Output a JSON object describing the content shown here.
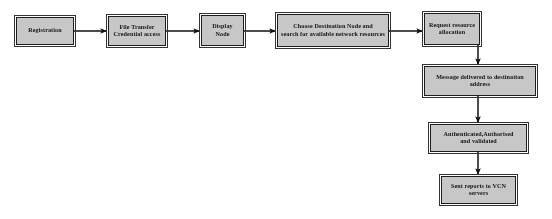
{
  "diagram": {
    "style": {
      "node_fill": "#c9c9c9",
      "node_border": "#141414",
      "arrow_color": "#101010",
      "background": "#ffffff"
    },
    "nodes": [
      {
        "id": "registration",
        "label": "Registration",
        "shape": "rectangle"
      },
      {
        "id": "file-transfer-credential-access",
        "label": "File Transfer\nCredential access",
        "shape": "rectangle"
      },
      {
        "id": "display-node",
        "label": "Display\nNode",
        "shape": "rectangle"
      },
      {
        "id": "choose-destination-node",
        "label": "Choose Destination Node and\nsearch for available network resources",
        "shape": "rectangle"
      },
      {
        "id": "request-resource-allocation",
        "label": "Request resource\nallocation",
        "shape": "rectangle"
      },
      {
        "id": "message-delivered",
        "label": "Message delivered to destination\naddress",
        "shape": "rectangle"
      },
      {
        "id": "authenticated-authorised-validated",
        "label": "Authenticated,Authorised\nand validated",
        "shape": "rectangle"
      },
      {
        "id": "sent-reports-vcn-servers",
        "label": "Sent reports to VCN\nservers",
        "shape": "rectangle"
      }
    ],
    "edges": [
      {
        "from": "registration",
        "to": "file-transfer-credential-access",
        "direction": "right"
      },
      {
        "from": "file-transfer-credential-access",
        "to": "display-node",
        "direction": "right"
      },
      {
        "from": "display-node",
        "to": "choose-destination-node",
        "direction": "right"
      },
      {
        "from": "choose-destination-node",
        "to": "request-resource-allocation",
        "direction": "right"
      },
      {
        "from": "request-resource-allocation",
        "to": "message-delivered",
        "direction": "down"
      },
      {
        "from": "message-delivered",
        "to": "authenticated-authorised-validated",
        "direction": "down"
      },
      {
        "from": "authenticated-authorised-validated",
        "to": "sent-reports-vcn-servers",
        "direction": "down"
      }
    ]
  }
}
